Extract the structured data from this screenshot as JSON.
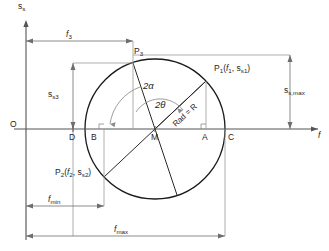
{
  "figure": {
    "type": "geometric-construction"
  },
  "axes": {
    "vertical_label": "s",
    "vertical_sub": "s",
    "horizontal_label": "f",
    "origin_label": "O"
  },
  "axis_points": [
    {
      "name": "point-d",
      "label": "D"
    },
    {
      "name": "point-b",
      "label": "B"
    },
    {
      "name": "point-m",
      "label": "M"
    },
    {
      "name": "point-a",
      "label": "A"
    },
    {
      "name": "point-c",
      "label": "C"
    }
  ],
  "points": {
    "p3": {
      "label": "P",
      "sub": "3"
    },
    "p1": {
      "label": "P",
      "sub": "1",
      "coords_open": "(",
      "coord_f": "f",
      "coord_f_sub": "1",
      "comma": ", ",
      "coord_s": "s",
      "coord_s_sub": "s1",
      "coords_close": ")"
    },
    "p2": {
      "label": "P",
      "sub": "2",
      "coords_open": "(",
      "coord_f": "f",
      "coord_f_sub": "2",
      "comma": ", ",
      "coord_s": "s",
      "coord_s_sub": "s2",
      "coords_close": ")"
    }
  },
  "angles": {
    "alpha": "2α",
    "theta": "2θ"
  },
  "radius": {
    "label": "Rad = R"
  },
  "dimensions": {
    "f3": {
      "label": "f",
      "sub": "3"
    },
    "ss3": {
      "label": "s",
      "sub": "s3"
    },
    "ss_max": {
      "label": "s",
      "sub": "s,max"
    },
    "f_min": {
      "label": "f",
      "sub": "min"
    },
    "f_max": {
      "label": "f",
      "sub": "max"
    }
  },
  "colors": {
    "stroke_dark": "#1a1a1a",
    "stroke_axis": "#555555",
    "stroke_helper": "#9a9a9a",
    "background": "#ffffff"
  },
  "geometry": {
    "center_x": 155,
    "center_y": 129,
    "radius_px": 70,
    "p1_x": 206,
    "p1_y": 81,
    "p3_x": 133,
    "p3_y": 63,
    "p2_x": 104,
    "p2_y": 173
  }
}
